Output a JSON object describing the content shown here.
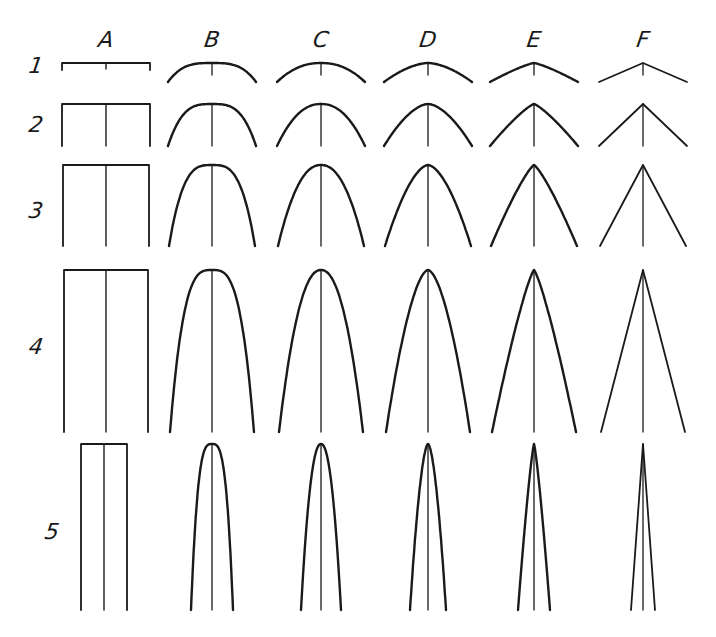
{
  "figure": {
    "stroke_color": "#1a1a1a",
    "background": "#ffffff",
    "columns": [
      {
        "id": "A",
        "label": "A",
        "cx": 106,
        "shape": "flat"
      },
      {
        "id": "B",
        "label": "B",
        "cx": 212,
        "shape": "blunt-ogive"
      },
      {
        "id": "C",
        "label": "C",
        "cx": 321,
        "shape": "elliptical"
      },
      {
        "id": "D",
        "label": "D",
        "cx": 428,
        "shape": "parabolic"
      },
      {
        "id": "E",
        "label": "E",
        "cx": 534,
        "shape": "near-conical"
      },
      {
        "id": "F",
        "label": "F",
        "cx": 643,
        "shape": "cone"
      }
    ],
    "rows": [
      {
        "id": "1",
        "label": "1",
        "label_y": 66,
        "top": 63,
        "bottom": 82
      },
      {
        "id": "2",
        "label": "2",
        "label_y": 125,
        "top": 104,
        "bottom": 146
      },
      {
        "id": "3",
        "label": "3",
        "label_y": 211,
        "top": 165,
        "bottom": 246
      },
      {
        "id": "4",
        "label": "4",
        "label_y": 347,
        "top": 270,
        "bottom": 432
      },
      {
        "id": "5",
        "label": "5",
        "label_y": 532,
        "top": 444,
        "bottom": 610
      }
    ],
    "column_label_y": 40,
    "row_label_x": 36
  }
}
